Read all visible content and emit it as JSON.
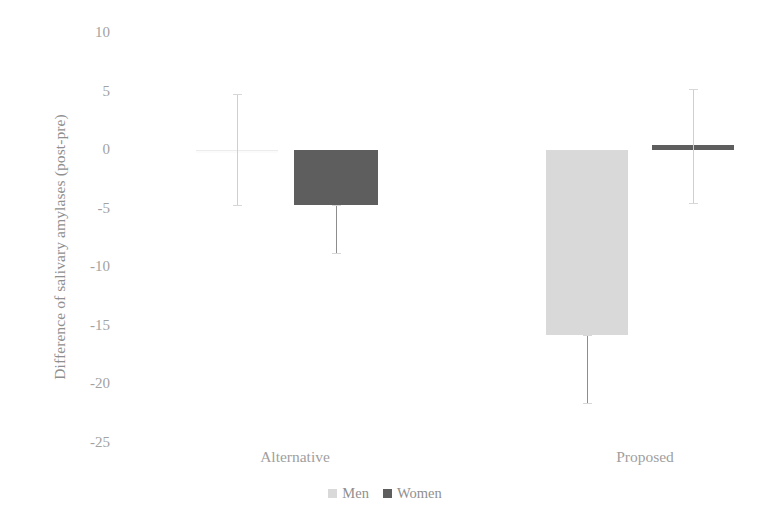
{
  "chart_data": {
    "type": "bar",
    "title": "",
    "xlabel": "",
    "ylabel": "Difference of salivary amylases (post-pre)",
    "categories": [
      "Alternative",
      "Proposed"
    ],
    "ylim": [
      -25,
      10
    ],
    "yticks": [
      10,
      5,
      0,
      -5,
      -10,
      -15,
      -20,
      -25
    ],
    "ytick_labels": [
      "10",
      "5",
      "0",
      "-5",
      "-10",
      "-15",
      "-20",
      "-25"
    ],
    "grid": false,
    "legend_position": "bottom",
    "series": [
      {
        "name": "Men",
        "color": "#d9d9d9",
        "values": [
          0.0,
          -15.8
        ],
        "errors_low": [
          -4.7,
          -21.6
        ],
        "errors_high": [
          4.8,
          -15.8
        ]
      },
      {
        "name": "Women",
        "color": "#5e5e5e",
        "values": [
          -4.7,
          0.4
        ],
        "errors_low": [
          -8.8,
          -4.5
        ],
        "errors_high": [
          -4.7,
          5.2
        ]
      }
    ],
    "legend": [
      {
        "label": "Men",
        "color": "#d9d9d9",
        "swatch": "light-gray-square"
      },
      {
        "label": "Women",
        "color": "#5e5e5e",
        "swatch": "dark-gray-square"
      }
    ]
  }
}
